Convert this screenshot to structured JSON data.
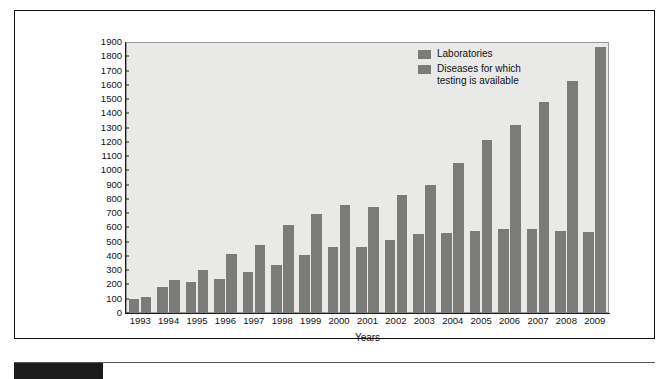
{
  "chart_data": {
    "type": "bar",
    "title": "",
    "xlabel": "Years",
    "ylabel": "",
    "ylim": [
      0,
      1900
    ],
    "ytick_step": 100,
    "grid": false,
    "legend_position": "top-right",
    "categories": [
      "1993",
      "1994",
      "1995",
      "1996",
      "1997",
      "1998",
      "1999",
      "2000",
      "2001",
      "2002",
      "2003",
      "2004",
      "2005",
      "2006",
      "2007",
      "2008",
      "2009"
    ],
    "series": [
      {
        "name": "Laboratories",
        "color": "#7b7b79",
        "values": [
          100,
          185,
          220,
          240,
          290,
          340,
          405,
          465,
          460,
          510,
          555,
          560,
          575,
          590,
          590,
          575,
          570
        ]
      },
      {
        "name": "Diseases for which testing is available",
        "color": "#7b7b79",
        "values": [
          110,
          230,
          300,
          415,
          475,
          615,
          695,
          755,
          745,
          830,
          900,
          1050,
          1215,
          1320,
          1480,
          1630,
          1865
        ]
      }
    ],
    "ytick_labels": [
      "1900",
      "1800",
      "1700",
      "1600",
      "1500",
      "1400",
      "1300",
      "1200",
      "1100",
      "1000",
      "900",
      "800",
      "700",
      "600",
      "500",
      "400",
      "300",
      "200",
      "100",
      "0"
    ],
    "legend_entries": [
      {
        "label": "Laboratories",
        "color": "#7b7b79"
      },
      {
        "label": "Diseases for which testing is available",
        "color": "#7b7b79"
      }
    ]
  },
  "legend": {
    "entry_1_label": "Laboratories",
    "entry_2_line_1": "Diseases for which",
    "entry_2_line_2": "testing is available"
  },
  "axis": {
    "x_title": "Years"
  },
  "style": {
    "plot_background": "#e9e9e7",
    "bar_color": "#7b7b79",
    "axis_color": "#1d1d1d",
    "frame_color": "#111111",
    "tab_color": "#1b1b1b"
  }
}
